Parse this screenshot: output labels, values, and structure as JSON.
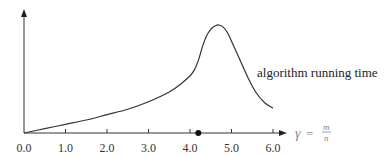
{
  "chart_data": {
    "type": "line",
    "title": "",
    "xlabel": "γ = m/n",
    "xlabel_parts": {
      "lhs": "γ",
      "eq": "=",
      "num": "m",
      "den": "n"
    },
    "ylabel": "",
    "xlim": [
      0.0,
      6.0
    ],
    "ylim": [
      0,
      1
    ],
    "grid": false,
    "legend": "none",
    "x_ticks": [
      "0.0",
      "1.0",
      "2.0",
      "3.0",
      "4.0",
      "5.0",
      "6.0"
    ],
    "y_ticks": [],
    "series": [
      {
        "name": "algorithm running time",
        "x": [
          0.0,
          0.5,
          1.0,
          1.5,
          2.0,
          2.5,
          3.0,
          3.5,
          3.8,
          4.0,
          4.1,
          4.2,
          4.3,
          4.4,
          4.5,
          4.6,
          4.7,
          4.8,
          4.9,
          5.0,
          5.2,
          5.4,
          5.6,
          5.8,
          6.0
        ],
        "values": [
          0.0,
          0.04,
          0.08,
          0.12,
          0.17,
          0.22,
          0.29,
          0.38,
          0.46,
          0.53,
          0.58,
          0.67,
          0.8,
          0.9,
          0.96,
          0.99,
          1.0,
          0.98,
          0.93,
          0.85,
          0.68,
          0.51,
          0.37,
          0.28,
          0.23
        ]
      }
    ],
    "annotations": [
      {
        "type": "curve-label",
        "text": "algorithm running time",
        "x": 5.2,
        "y": 0.68
      },
      {
        "type": "marker-dot",
        "x": 4.2,
        "y": 0
      }
    ]
  }
}
